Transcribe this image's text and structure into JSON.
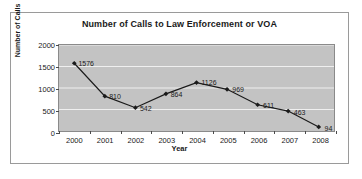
{
  "chart_data": {
    "type": "line",
    "title": "Number of Calls to Law Enforcement or VOA",
    "xlabel": "Year",
    "ylabel": "Number of Calls",
    "categories": [
      "2000",
      "2001",
      "2002",
      "2003",
      "2004",
      "2005",
      "2006",
      "2007",
      "2008"
    ],
    "values": [
      1576,
      810,
      542,
      864,
      1126,
      969,
      611,
      463,
      94
    ],
    "point_labels": [
      "1576",
      "810",
      "542",
      "864",
      "1126",
      "969",
      "611",
      "463",
      "94"
    ],
    "ylim": [
      0,
      2000
    ],
    "y_ticks": [
      "0",
      "500",
      "1000",
      "1500",
      "2000"
    ],
    "y_tick_values": [
      0,
      500,
      1000,
      1500,
      2000
    ],
    "grid": true,
    "grid_axis": "y",
    "legend": false,
    "series": [
      {
        "name": "Number of Calls",
        "values": [
          1576,
          810,
          542,
          864,
          1126,
          969,
          611,
          463,
          94
        ]
      }
    ],
    "colors": {
      "plot_background": "#c3c3c3",
      "gridline": "#f0f0f0",
      "series_line": "#1a1a1a",
      "marker": "#1a1a1a",
      "frame_border": "#9a9a9a",
      "text": "#1a1a1a"
    },
    "marker_style": "diamond"
  }
}
